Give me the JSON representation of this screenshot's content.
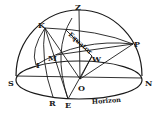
{
  "diagram": {
    "colors": {
      "ink": "#1a1a1a",
      "background": "#ffffff"
    },
    "points": {
      "Z": {
        "label": "Z",
        "x": 79,
        "y": 10
      },
      "K": {
        "label": "K",
        "x": 45,
        "y": 28
      },
      "P": {
        "label": "P",
        "x": 133,
        "y": 44
      },
      "M": {
        "label": "M",
        "x": 56,
        "y": 55
      },
      "W": {
        "label": "W",
        "x": 92,
        "y": 56
      },
      "I": {
        "label": "I",
        "x": 42,
        "y": 63
      },
      "S": {
        "label": "S",
        "x": 16,
        "y": 76
      },
      "O": {
        "label": "O",
        "x": 80,
        "y": 79
      },
      "N": {
        "label": "N",
        "x": 142,
        "y": 76
      },
      "R": {
        "label": "R",
        "x": 53,
        "y": 97
      },
      "E": {
        "label": "E",
        "x": 68,
        "y": 99
      }
    },
    "curve_labels": {
      "equator": "Equator",
      "horizon": "Horizon"
    }
  }
}
